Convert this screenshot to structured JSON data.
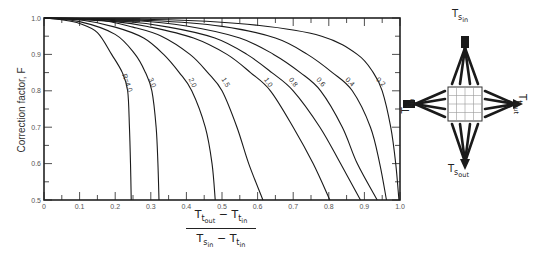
{
  "chart_data": {
    "type": "line",
    "title": "",
    "xlabel": "(T_t,out − T_t,in) / (T_s,in − T_t,in)",
    "ylabel": "Correction factor, F",
    "xlim": [
      0,
      1.0
    ],
    "ylim": [
      0.5,
      1.0
    ],
    "grid": false,
    "x_ticks": [
      "0",
      "0.1",
      "0.2",
      "0.3",
      "0.4",
      "0.5",
      "0.6",
      "0.7",
      "0.8",
      "0.9",
      "1.0"
    ],
    "y_ticks": [
      "0.5",
      "0.6",
      "0.7",
      "0.8",
      "0.9",
      "1.0"
    ],
    "legend": "inline curve labels (parameter R)",
    "series": [
      {
        "name": "R=4.0",
        "label": "R=4.0",
        "points": [
          [
            0,
            1.0
          ],
          [
            0.05,
            0.995
          ],
          [
            0.1,
            0.985
          ],
          [
            0.15,
            0.96
          ],
          [
            0.19,
            0.9
          ],
          [
            0.22,
            0.85
          ],
          [
            0.235,
            0.8
          ],
          [
            0.24,
            0.7
          ],
          [
            0.243,
            0.6
          ],
          [
            0.245,
            0.5
          ]
        ]
      },
      {
        "name": "R=3.0",
        "label": "3.0",
        "points": [
          [
            0,
            1.0
          ],
          [
            0.1,
            0.99
          ],
          [
            0.2,
            0.955
          ],
          [
            0.256,
            0.9
          ],
          [
            0.285,
            0.85
          ],
          [
            0.303,
            0.8
          ],
          [
            0.315,
            0.7
          ],
          [
            0.32,
            0.6
          ],
          [
            0.323,
            0.5
          ]
        ]
      },
      {
        "name": "R=2.0",
        "label": "2.0",
        "points": [
          [
            0,
            1.0
          ],
          [
            0.1,
            0.995
          ],
          [
            0.2,
            0.975
          ],
          [
            0.28,
            0.945
          ],
          [
            0.336,
            0.9
          ],
          [
            0.38,
            0.85
          ],
          [
            0.415,
            0.8
          ],
          [
            0.453,
            0.7
          ],
          [
            0.472,
            0.6
          ],
          [
            0.481,
            0.5
          ]
        ]
      },
      {
        "name": "R=1.5",
        "label": "1.5",
        "points": [
          [
            0,
            1.0
          ],
          [
            0.15,
            0.995
          ],
          [
            0.25,
            0.975
          ],
          [
            0.33,
            0.95
          ],
          [
            0.41,
            0.9
          ],
          [
            0.46,
            0.85
          ],
          [
            0.5,
            0.8
          ],
          [
            0.542,
            0.7
          ],
          [
            0.575,
            0.6
          ],
          [
            0.615,
            0.5
          ]
        ]
      },
      {
        "name": "R=1.0",
        "label": "1.0",
        "points": [
          [
            0,
            1.0
          ],
          [
            0.2,
            0.99
          ],
          [
            0.3,
            0.975
          ],
          [
            0.42,
            0.945
          ],
          [
            0.514,
            0.9
          ],
          [
            0.58,
            0.85
          ],
          [
            0.636,
            0.8
          ],
          [
            0.7,
            0.7
          ],
          [
            0.756,
            0.6
          ],
          [
            0.803,
            0.5
          ]
        ]
      },
      {
        "name": "R=0.8",
        "label": "0.8",
        "points": [
          [
            0,
            1.0
          ],
          [
            0.2,
            0.993
          ],
          [
            0.35,
            0.975
          ],
          [
            0.48,
            0.945
          ],
          [
            0.57,
            0.9
          ],
          [
            0.64,
            0.85
          ],
          [
            0.7,
            0.8
          ],
          [
            0.775,
            0.7
          ],
          [
            0.833,
            0.6
          ],
          [
            0.889,
            0.5
          ]
        ]
      },
      {
        "name": "R=0.6",
        "label": "0.6",
        "points": [
          [
            0,
            1.0
          ],
          [
            0.25,
            0.993
          ],
          [
            0.4,
            0.978
          ],
          [
            0.55,
            0.945
          ],
          [
            0.645,
            0.9
          ],
          [
            0.72,
            0.85
          ],
          [
            0.777,
            0.8
          ],
          [
            0.838,
            0.7
          ],
          [
            0.88,
            0.6
          ],
          [
            0.936,
            0.5
          ]
        ]
      },
      {
        "name": "R=0.4",
        "label": "0.4",
        "points": [
          [
            0,
            1.0
          ],
          [
            0.3,
            0.993
          ],
          [
            0.5,
            0.977
          ],
          [
            0.65,
            0.945
          ],
          [
            0.74,
            0.9
          ],
          [
            0.81,
            0.85
          ],
          [
            0.866,
            0.8
          ],
          [
            0.917,
            0.7
          ],
          [
            0.943,
            0.6
          ],
          [
            0.962,
            0.5
          ]
        ]
      },
      {
        "name": "R=0.2",
        "label": "0.2",
        "points": [
          [
            0,
            1.0
          ],
          [
            0.35,
            0.995
          ],
          [
            0.6,
            0.98
          ],
          [
            0.78,
            0.95
          ],
          [
            0.88,
            0.9
          ],
          [
            0.925,
            0.85
          ],
          [
            0.95,
            0.8
          ],
          [
            0.974,
            0.7
          ],
          [
            0.988,
            0.6
          ],
          [
            0.997,
            0.5
          ]
        ]
      }
    ],
    "label_positions": [
      {
        "label": "R=4.0",
        "x": 0.228,
        "y": 0.82
      },
      {
        "label": "3.0",
        "x": 0.298,
        "y": 0.82
      },
      {
        "label": "2.0",
        "x": 0.412,
        "y": 0.82
      },
      {
        "label": "1.5",
        "x": 0.505,
        "y": 0.82
      },
      {
        "label": "1.0",
        "x": 0.625,
        "y": 0.82
      },
      {
        "label": "0.8",
        "x": 0.695,
        "y": 0.82
      },
      {
        "label": "0.6",
        "x": 0.773,
        "y": 0.82
      },
      {
        "label": "0.4",
        "x": 0.855,
        "y": 0.82
      },
      {
        "label": "0.2",
        "x": 0.942,
        "y": 0.82
      }
    ]
  },
  "axis": {
    "ylabel": "Correction factor, F",
    "xlabel_numerator": {
      "T": "T",
      "s1": "t",
      "s2": "out",
      "minus": " − ",
      "T2": "T",
      "s3": "t",
      "s4": "in"
    },
    "xlabel_denominator": {
      "T": "T",
      "s1": "s",
      "s2": "in",
      "minus": " − ",
      "T2": "T",
      "s3": "t",
      "s4": "in"
    }
  },
  "diagram": {
    "top_label": {
      "T": "T",
      "s1": "s",
      "s2": "in"
    },
    "bottom_label": {
      "T": "T",
      "s1": "s",
      "s2": "out"
    },
    "left_label": {
      "T": "T",
      "s1": "t",
      "s2": "in"
    },
    "right_label": {
      "T": "T",
      "s1": "t",
      "s2": "out"
    },
    "grid_cells": 4
  }
}
